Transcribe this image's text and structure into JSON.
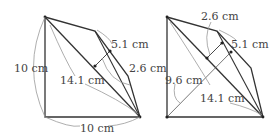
{
  "figures": [
    {
      "name": "left-figure",
      "labels": {
        "side_left": "10 cm",
        "side_bottom": "10 cm",
        "diagonal": "14.1 cm",
        "height_outer": "5.1 cm",
        "height_inner": "2.6 cm"
      }
    },
    {
      "name": "right-figure",
      "labels": {
        "height_inner": "2.6 cm",
        "height_outer": "5.1 cm",
        "diagonal_perp": "9.6 cm",
        "diagonal": "14.1 cm"
      }
    }
  ],
  "colors": {
    "line": "#333333",
    "guide": "#999999",
    "text": "#444444"
  }
}
